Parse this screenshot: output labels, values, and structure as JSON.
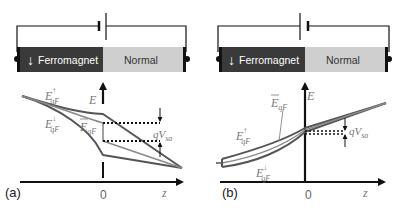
{
  "panels": [
    {
      "id": "a",
      "label": "(a)",
      "bar": {
        "left": "Ferromagnet",
        "right": "Normal",
        "arrow": "↓"
      },
      "axis": {
        "y": "E",
        "x": "z",
        "origin": "0"
      },
      "curves": {
        "up": "E",
        "up_sup": "↑",
        "sub": "qF",
        "down": "E",
        "down_sup": "↓",
        "mean": "E",
        "mean_sub": "qF"
      },
      "voltage": {
        "q": "qV",
        "sub": "sa"
      }
    },
    {
      "id": "b",
      "label": "(b)",
      "bar": {
        "left": "Ferromagnet",
        "right": "Normal",
        "arrow": "↓"
      },
      "axis": {
        "y": "E",
        "x": "z",
        "origin": "0"
      },
      "curves": {
        "up": "E",
        "up_sup": "↑",
        "sub": "qF",
        "down": "E",
        "down_sup": "↓",
        "mean": "E",
        "mean_sub": "qF"
      },
      "voltage": {
        "q": "qV",
        "sub": "sa"
      }
    }
  ],
  "colors": {
    "ferromagnet": "#3a3a3a",
    "normal": "#cfcfcf",
    "curve_dark": "#555555",
    "curve_light": "#8a8a8a"
  }
}
